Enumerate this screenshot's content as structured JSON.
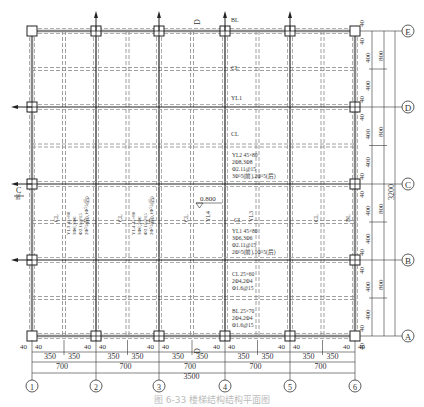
{
  "drawing": {
    "caption": "图 6-33  楼梯结构结构平面图",
    "col_axes": [
      "1",
      "2",
      "3",
      "4",
      "5",
      "6"
    ],
    "row_axes": [
      "A",
      "B",
      "C",
      "D",
      "E"
    ],
    "bottom_dims": {
      "row1": [
        "40",
        "40",
        "350",
        "350",
        "40",
        "40",
        "350",
        "350",
        "40",
        "40",
        "350",
        "350",
        "40",
        "40",
        "350",
        "350",
        "40",
        "40",
        "350",
        "350",
        "40",
        "40"
      ],
      "row2": [
        "700",
        "700",
        "700",
        "700",
        "700"
      ],
      "total": "3500"
    },
    "right_dims": {
      "inner": [
        "40",
        "40",
        "400",
        "400",
        "40",
        "40",
        "400",
        "400",
        "40",
        "40",
        "400",
        "400",
        "40",
        "40",
        "400",
        "400",
        "40",
        "40"
      ],
      "mid": [
        "800",
        "800",
        "800",
        "800"
      ],
      "total": "3200"
    },
    "labels": {
      "bl_top": "BL",
      "cl_top": "CL",
      "yl1_top": "YL1",
      "cl_d": "CL",
      "yl2": [
        "YL2 45×80",
        "2Φ8,3Φ8",
        "Φ2.11@15",
        "3Φ⁵5(前),2Φ⁵5(后)"
      ],
      "yl1": [
        "YL1 45×80",
        "3Φ6,3Φ6",
        "Φ2.11@15",
        "2Φ⁵5(前),1Φ⁵5(后)"
      ],
      "cl_spec": [
        "CL 25×60",
        "2Φ4,2Φ4",
        "Φ1.6@15"
      ],
      "bl_spec": [
        "BL 25×70",
        "2Φ4,2Φ4",
        "Φ1.6@15"
      ],
      "yl3_vert": [
        "YL3 45×80",
        "3Φ6,3Φ6",
        "Φ2.11@15",
        "2Φ⁵5(前),1Φ⁵5(后)"
      ],
      "yl4_vert": [
        "YL4 45×80",
        "3Φ6,3Φ6",
        "Φ2.11@15",
        "2Φ⁵5(前),1Φ⁵5(后)"
      ],
      "elev": "0.800",
      "cl": "CL",
      "yl3": "YL3",
      "yl4": "YL4",
      "bl": "BL",
      "section_c": "C",
      "section_d": "D"
    }
  }
}
